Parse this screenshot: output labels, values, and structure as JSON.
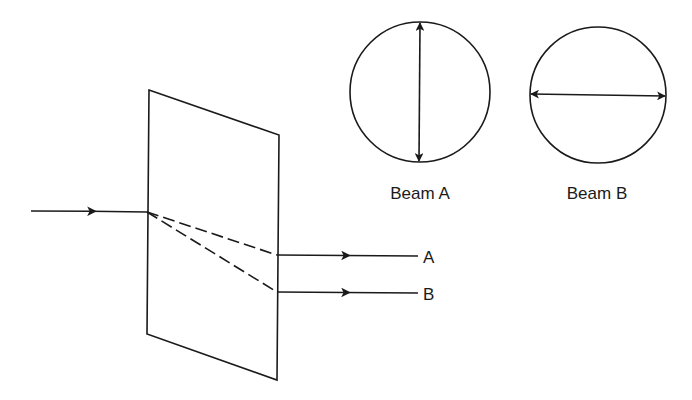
{
  "diagram": {
    "incident_beam": {
      "label": ""
    },
    "output_beams": [
      {
        "label": "A"
      },
      {
        "label": "B"
      }
    ],
    "polarization_insets": [
      {
        "caption": "Beam A",
        "orientation": "vertical"
      },
      {
        "caption": "Beam B",
        "orientation": "horizontal"
      }
    ],
    "colors": {
      "ink": "#1a1a1a",
      "background": "#ffffff"
    }
  }
}
